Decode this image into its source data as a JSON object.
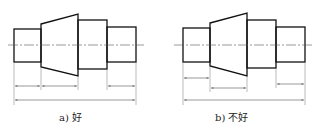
{
  "figures": [
    {
      "id": "a",
      "caption": "a) 好",
      "stroke_color": "#111111",
      "thin_color": "#555555",
      "dimension_layout": "chained dimensions on one row plus overall length"
    },
    {
      "id": "b",
      "caption": "b) 不好",
      "stroke_color": "#111111",
      "thin_color": "#555555",
      "dimension_layout": "dimensions staggered on different rows plus overall length"
    }
  ]
}
